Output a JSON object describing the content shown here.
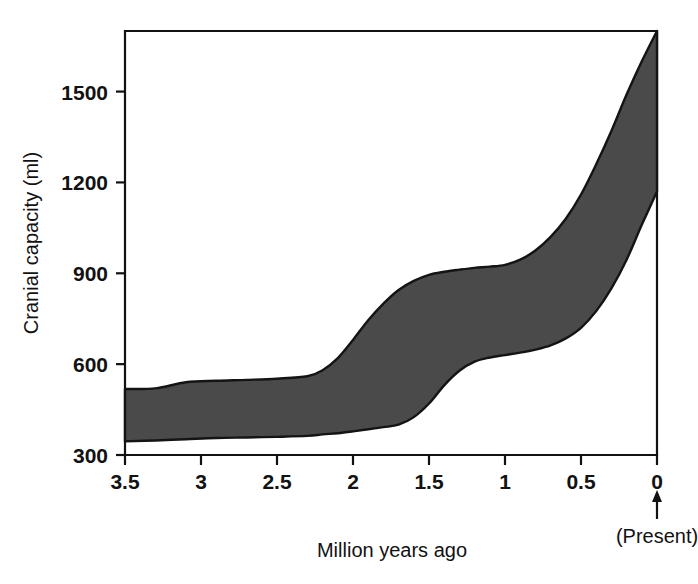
{
  "chart_data": {
    "type": "area",
    "title": "",
    "subtitle": "",
    "xlabel": "Million years ago",
    "ylabel": "Cranial capacity (ml)",
    "xlim": [
      3.5,
      0
    ],
    "ylim": [
      300,
      1700
    ],
    "x_ticks": [
      "3.5",
      "3",
      "2.5",
      "2",
      "1.5",
      "1",
      "0.5",
      "0"
    ],
    "x_tick_values": [
      3.5,
      3,
      2.5,
      2,
      1.5,
      1,
      0.5,
      0
    ],
    "y_ticks": [
      "300",
      "600",
      "900",
      "1200",
      "1500"
    ],
    "y_tick_values": [
      300,
      600,
      900,
      1200,
      1500
    ],
    "x_axis_inverted": true,
    "grid": false,
    "legend": null,
    "annotations": [
      {
        "name": "present-marker",
        "text": "(Present)",
        "x_value": 0,
        "arrow": "up"
      }
    ],
    "series": [
      {
        "name": "Cranial capacity range (hominin)",
        "type": "band",
        "fill_color": "#4a4a4a",
        "edge_color": "#141414",
        "x": [
          3.5,
          3.3,
          3.1,
          2.9,
          2.7,
          2.5,
          2.3,
          2.2,
          2.1,
          2.0,
          1.9,
          1.8,
          1.7,
          1.6,
          1.5,
          1.4,
          1.3,
          1.2,
          1.1,
          1.0,
          0.9,
          0.8,
          0.7,
          0.6,
          0.5,
          0.4,
          0.3,
          0.2,
          0.1,
          0.0
        ],
        "upper": [
          518,
          520,
          540,
          545,
          548,
          552,
          560,
          580,
          620,
          680,
          745,
          800,
          845,
          875,
          895,
          905,
          912,
          918,
          922,
          928,
          945,
          975,
          1020,
          1080,
          1160,
          1260,
          1370,
          1490,
          1600,
          1700
        ],
        "lower": [
          345,
          348,
          352,
          356,
          358,
          360,
          363,
          368,
          372,
          378,
          385,
          392,
          400,
          425,
          470,
          530,
          578,
          608,
          622,
          630,
          638,
          648,
          662,
          685,
          720,
          775,
          850,
          945,
          1060,
          1170
        ]
      }
    ]
  },
  "axis": {
    "ylabel": "Cranial capacity (ml)",
    "xlabel": "Million years ago",
    "present_label": "(Present)"
  },
  "icons": {
    "present_arrow": "arrow-up-icon"
  }
}
